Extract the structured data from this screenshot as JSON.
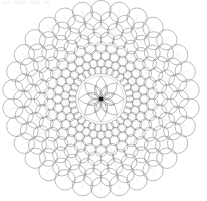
{
  "document": {
    "title": "Geometric Rosette Mandala",
    "kind": "line-drawing",
    "width": 207,
    "height": 201,
    "background_color": "#ffffff",
    "stroke_color": "#6b6b6b",
    "stroke_color_dark": "#3a3a3a",
    "stroke_width": 0.45
  },
  "mandala": {
    "center_x": 101,
    "center_y": 99,
    "outer_radius": 92,
    "center_dot": {
      "radius": 2.2,
      "color": "#1a1a1a",
      "shape": "square-dot"
    },
    "rosette": {
      "petal_count": 8,
      "petal_length": 23,
      "petal_width": 11,
      "secondary_petal_count": 8,
      "secondary_petal_length": 15,
      "secondary_petal_width": 7,
      "inner_ring_radius": 23
    },
    "rings": [
      {
        "index": 1,
        "ring_radius": 29,
        "circle_radius": 4.0,
        "circle_count": 30
      },
      {
        "index": 2,
        "ring_radius": 36,
        "circle_radius": 4.6,
        "circle_count": 30
      },
      {
        "index": 3,
        "ring_radius": 43.5,
        "circle_radius": 5.2,
        "circle_count": 30
      },
      {
        "index": 4,
        "ring_radius": 51.5,
        "circle_radius": 6.0,
        "circle_count": 30
      },
      {
        "index": 5,
        "ring_radius": 60,
        "circle_radius": 6.9,
        "circle_count": 30
      },
      {
        "index": 6,
        "ring_radius": 69,
        "circle_radius": 7.9,
        "circle_count": 30
      },
      {
        "index": 7,
        "ring_radius": 78.5,
        "circle_radius": 9.0,
        "circle_count": 30
      },
      {
        "index": 8,
        "ring_radius": 88.5,
        "circle_radius": 10.2,
        "circle_count": 30
      }
    ],
    "radial_spokes": {
      "count": 30,
      "inner_radius": 23,
      "outer_radius": 92,
      "visible": true
    }
  },
  "artifacts": [
    {
      "name": "top-left-smudge-1",
      "x": 2,
      "y": 1,
      "width": 9,
      "height": 3
    },
    {
      "name": "top-left-smudge-2",
      "x": 14,
      "y": 1,
      "width": 12,
      "height": 3
    },
    {
      "name": "top-left-smudge-3",
      "x": 30,
      "y": 1,
      "width": 10,
      "height": 3
    },
    {
      "name": "top-left-smudge-4",
      "x": 44,
      "y": 1,
      "width": 6,
      "height": 3
    }
  ]
}
